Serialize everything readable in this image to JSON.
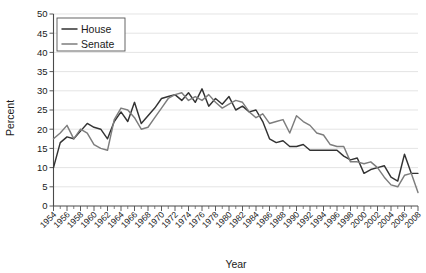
{
  "chart_data": {
    "type": "line",
    "title": "",
    "xlabel": "Year",
    "ylabel": "Percent",
    "xlim": [
      1954,
      2008
    ],
    "ylim": [
      0,
      50
    ],
    "ytick_step": 5,
    "xtick_step": 2,
    "grid": true,
    "legend_position": "top-left",
    "yticks": [
      0,
      5,
      10,
      15,
      20,
      25,
      30,
      35,
      40,
      45,
      50
    ],
    "xticks": [
      1954,
      1956,
      1958,
      1960,
      1962,
      1964,
      1966,
      1968,
      1970,
      1972,
      1974,
      1976,
      1978,
      1980,
      1982,
      1984,
      1986,
      1988,
      1990,
      1992,
      1994,
      1996,
      1998,
      2000,
      2002,
      2004,
      2006,
      2008
    ],
    "x": [
      1954,
      1955,
      1956,
      1957,
      1958,
      1959,
      1960,
      1961,
      1962,
      1963,
      1964,
      1965,
      1966,
      1967,
      1968,
      1969,
      1970,
      1971,
      1972,
      1973,
      1974,
      1975,
      1976,
      1977,
      1978,
      1979,
      1980,
      1981,
      1982,
      1983,
      1984,
      1985,
      1986,
      1987,
      1988,
      1989,
      1990,
      1991,
      1992,
      1993,
      1994,
      1995,
      1996,
      1997,
      1998,
      1999,
      2000,
      2001,
      2002,
      2003,
      2004,
      2005,
      2006,
      2007,
      2008
    ],
    "series": [
      {
        "name": "House",
        "color": "#333333",
        "values": [
          10.0,
          16.5,
          18.0,
          17.5,
          19.5,
          21.5,
          20.5,
          20.0,
          17.5,
          22.0,
          24.5,
          22.0,
          27.0,
          21.5,
          23.5,
          25.5,
          28.0,
          28.5,
          29.0,
          27.5,
          29.5,
          27.0,
          30.5,
          26.0,
          28.0,
          26.5,
          28.5,
          25.0,
          26.0,
          24.5,
          25.0,
          22.0,
          17.5,
          16.5,
          17.0,
          15.5,
          15.5,
          16.0,
          14.5,
          14.5,
          14.5,
          14.5,
          14.5,
          13.0,
          12.0,
          12.5,
          8.5,
          9.5,
          10.0,
          10.5,
          7.5,
          6.5,
          13.5,
          8.5,
          8.5
        ]
      },
      {
        "name": "Senate",
        "color": "#7d7d7d",
        "values": [
          17.5,
          19.0,
          21.0,
          17.5,
          20.0,
          19.0,
          16.0,
          15.0,
          14.5,
          22.5,
          25.5,
          25.0,
          23.0,
          20.0,
          20.5,
          23.0,
          25.5,
          28.0,
          29.0,
          29.5,
          27.5,
          28.5,
          27.5,
          29.0,
          27.0,
          25.5,
          26.5,
          27.5,
          27.0,
          24.5,
          23.0,
          24.0,
          21.5,
          22.0,
          22.5,
          19.0,
          23.5,
          22.0,
          21.0,
          19.0,
          18.5,
          16.0,
          15.5,
          15.5,
          11.5,
          11.5,
          11.0,
          11.5,
          10.0,
          7.5,
          5.5,
          5.0,
          8.0,
          8.5,
          3.5
        ]
      }
    ]
  },
  "legend": {
    "entries": [
      {
        "label": "House"
      },
      {
        "label": "Senate"
      }
    ]
  },
  "axes": {
    "y_title": "Percent",
    "x_title": "Year"
  }
}
